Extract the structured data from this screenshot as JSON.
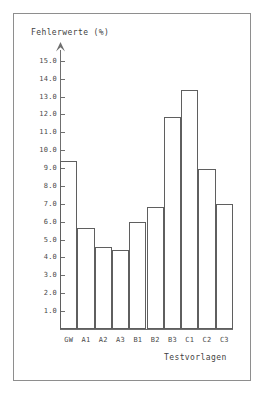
{
  "chart_data": {
    "type": "bar",
    "title": "",
    "ylabel": "Fehlerwerte (%)",
    "xlabel": "Testvorlagen",
    "categories": [
      "GW",
      "A1",
      "A2",
      "A3",
      "B1",
      "B2",
      "B3",
      "C1",
      "C2",
      "C3"
    ],
    "values": [
      9.4,
      5.65,
      4.6,
      4.4,
      6.0,
      6.8,
      11.85,
      13.35,
      8.95,
      7.0
    ],
    "ylim": [
      0,
      15.6
    ],
    "ytick_labels": [
      "1.0",
      "2.0",
      "3.0",
      "4.0",
      "5.0",
      "6.0",
      "7.0",
      "8.0",
      "9.0",
      "10.0",
      "11.0",
      "12.0",
      "13.0",
      "14.0",
      "15.0"
    ],
    "ytick_values": [
      1,
      2,
      3,
      4,
      5,
      6,
      7,
      8,
      9,
      10,
      11,
      12,
      13,
      14,
      15
    ],
    "grid": false,
    "legend": null,
    "colors": {
      "bar_outline": "#5f5f5f",
      "bar_fill": "transparent",
      "axis": "#6f6f6f",
      "text": "#4a4a4a",
      "frame": "#8e8e8e",
      "background": "#ffffff"
    }
  }
}
